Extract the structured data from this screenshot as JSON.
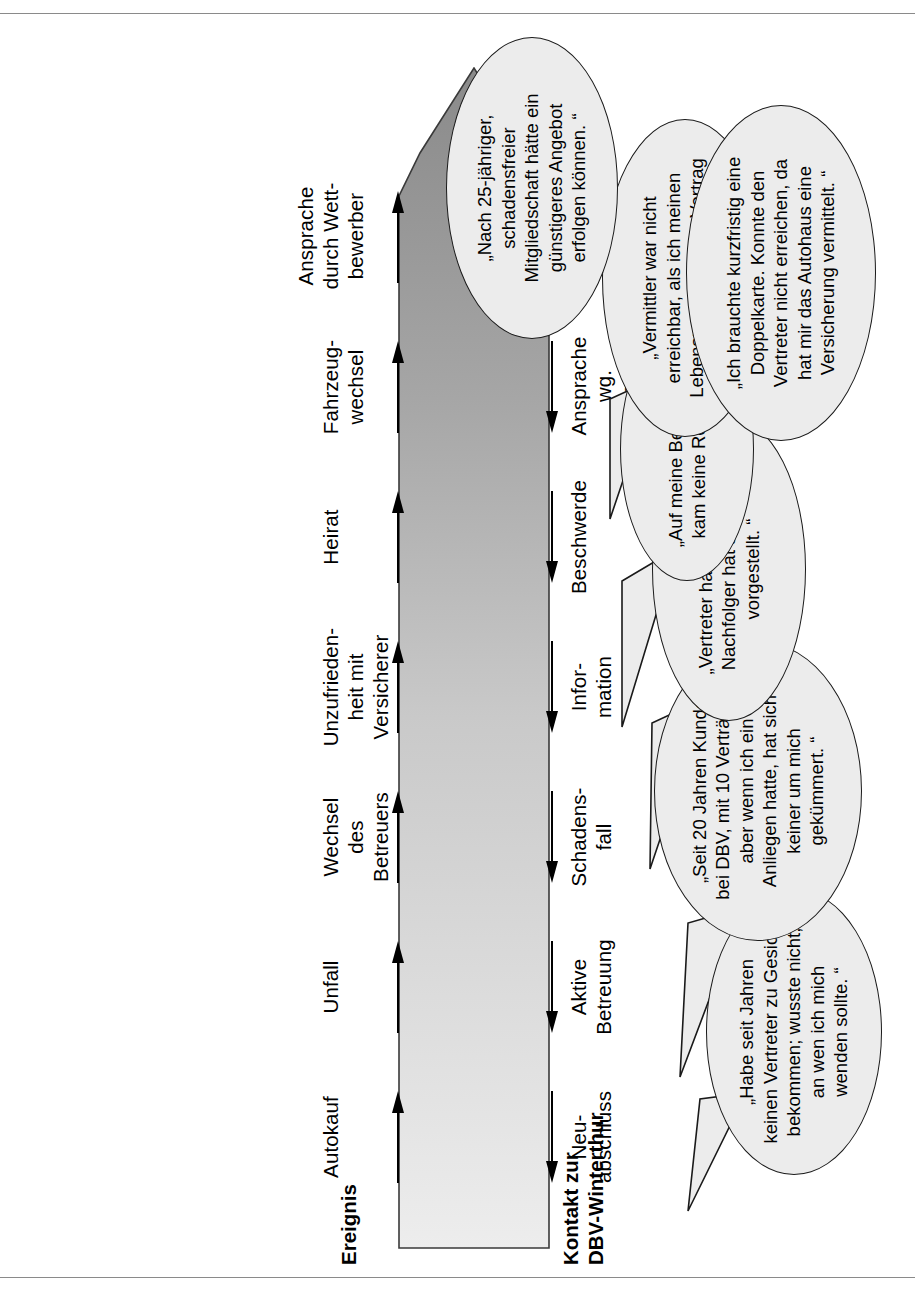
{
  "diagram": {
    "title_left": "Ereignis",
    "title_right": "Kontakt zur\nDBV-Winterthur",
    "events": [
      "Autokauf",
      "Unfall",
      "Wechsel\ndes\nBetreuers",
      "Unzufrieden-\nheit mit\nVersicherer",
      "Heirat",
      "Fahrzeug-\nwechsel",
      "Ansprache\ndurch Wett-\nbewerber"
    ],
    "contacts": [
      "Neu-\nabschluss",
      "Aktive\nBetreuung",
      "Schadens-\nfall",
      "Infor-\nmation",
      "Beschwerde",
      "Ansprache\nwg.\nDoppel-\nversicherung",
      "Angebots-\nanfrage"
    ],
    "quotes": [
      "„Habe seit Jahren\nkeinen Vertreter zu Gesicht\nbekommen; wusste nicht,\nan wen ich mich\nwenden sollte. “",
      "„Seit 20 Jahren Kunde\nbei DBV, mit 10 Verträgen,\naber wenn ich ein\nAnliegen hatte, hat sich\nkeiner um mich\ngekümmert. “",
      "„Vertreter hat gewechselt,\nNachfolger hat sich nicht\nvorgestellt. “",
      "„Auf meine Beschwerde\nkam keine Reaktion. “",
      "„Vermittler war nicht\nerreichbar, als ich meinen\nLebenspartner in den Vertrag\naufnehmen wollte. “",
      "„Ich brauchte kurzfristig eine\nDoppelkarte. Konnte den\nVertreter nicht erreichen, da\nhat mir das Autohaus eine\nVersicherung vermittelt. “",
      "„Nach 25-jähriger,\nschadensfreier\nMitgliedschaft hätte ein\ngünstigeres Angebot\nerfolgen können. “"
    ],
    "colors": {
      "arrow_light": "#e8e8e8",
      "arrow_dark": "#8f8f8f",
      "bubble_fill": "#ececec",
      "outline": "#1a1a1a",
      "rule": "#8a8a8a"
    }
  }
}
